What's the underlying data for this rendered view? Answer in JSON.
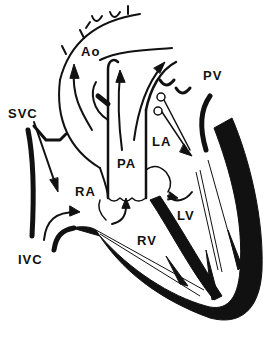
{
  "diagram": {
    "type": "anatomical-line-drawing",
    "labels": {
      "ao": "Ao",
      "pv": "PV",
      "svc": "SVC",
      "la": "LA",
      "pa": "PA",
      "ra": "RA",
      "lv": "LV",
      "ivc": "IVC",
      "rv": "RV"
    },
    "colors": {
      "ink": "#111111",
      "background": "#ffffff"
    }
  }
}
